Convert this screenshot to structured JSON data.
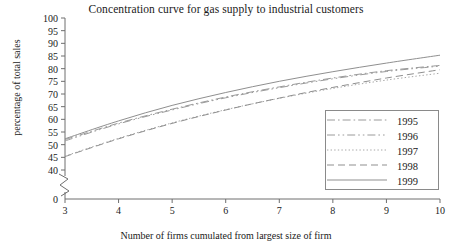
{
  "chart_data": {
    "type": "line",
    "title": "Concentration curve for gas supply to industrial customers",
    "xlabel": "Number of firms cumulated from largest size of firm",
    "ylabel": "percentage of total sales",
    "x": [
      3,
      4,
      5,
      6,
      7,
      8,
      9,
      10
    ],
    "xlim": [
      3,
      10
    ],
    "ylim": [
      40,
      100
    ],
    "y_axis_break": true,
    "y_break_label": "0",
    "xticks": [
      "3",
      "4",
      "5",
      "6",
      "7",
      "8",
      "9",
      "10"
    ],
    "yticks": [
      "100",
      "95",
      "90",
      "85",
      "80",
      "75",
      "70",
      "65",
      "60",
      "55",
      "50",
      "45",
      "40",
      "0"
    ],
    "grid": false,
    "legend_position": "lower right",
    "series": [
      {
        "name": "1995",
        "style": "dash-dot",
        "color": "#9a9a9a",
        "values": [
          52.0,
          58.5,
          64.0,
          68.8,
          72.8,
          76.3,
          79.2,
          81.3
        ]
      },
      {
        "name": "1996",
        "style": "dash-dot-dot",
        "color": "#9a9a9a",
        "values": [
          51.5,
          58.2,
          63.7,
          68.5,
          72.5,
          76.0,
          78.9,
          81.0
        ]
      },
      {
        "name": "1997",
        "style": "dotted",
        "color": "#a8a8a8",
        "values": [
          45.5,
          52.5,
          58.6,
          63.8,
          68.3,
          72.2,
          75.5,
          78.2
        ]
      },
      {
        "name": "1998",
        "style": "dashed",
        "color": "#8f8f8f",
        "values": [
          45.3,
          52.3,
          58.4,
          63.7,
          68.4,
          72.6,
          76.3,
          79.6
        ]
      },
      {
        "name": "1999",
        "style": "solid",
        "color": "#8f8f8f",
        "values": [
          52.3,
          59.4,
          65.5,
          70.6,
          75.0,
          78.8,
          82.2,
          85.3
        ]
      }
    ]
  },
  "legend": {
    "entries": [
      {
        "label": "1995"
      },
      {
        "label": "1996"
      },
      {
        "label": "1997"
      },
      {
        "label": "1998"
      },
      {
        "label": "1999"
      }
    ]
  }
}
